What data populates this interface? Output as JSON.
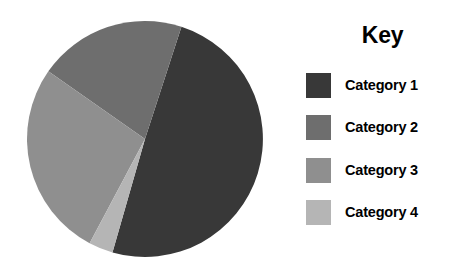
{
  "chart_data": {
    "type": "pie",
    "title": "",
    "legend_title": "Key",
    "legend_position": "right",
    "grid": false,
    "categories": [
      "Category 1",
      "Category 2",
      "Category 3",
      "Category 4"
    ],
    "values": [
      49,
      20,
      27,
      4
    ],
    "unit": "percent",
    "start_angle_deg": 18,
    "direction": "counterclockwise",
    "slices": [
      {
        "label": "Category 1",
        "value": 49,
        "color": "#383838",
        "start_deg": 18,
        "end_deg": 196
      },
      {
        "label": "Category 2",
        "value": 20,
        "color": "#6e6e6e",
        "start_deg": 305,
        "end_deg": 18
      },
      {
        "label": "Category 3",
        "value": 27,
        "color": "#8f8f8f",
        "start_deg": 208,
        "end_deg": 305
      },
      {
        "label": "Category 4",
        "value": 4,
        "color": "#b5b5b5",
        "start_deg": 196,
        "end_deg": 208
      }
    ],
    "geometry": {
      "center_x": 145,
      "center_y": 139,
      "radius": 118
    }
  },
  "legend": {
    "title": "Key",
    "items": [
      {
        "label": "Category 1",
        "color": "#383838",
        "swatch_icon": "color-swatch-icon"
      },
      {
        "label": "Category 2",
        "color": "#6e6e6e",
        "swatch_icon": "color-swatch-icon"
      },
      {
        "label": "Category 3",
        "color": "#8f8f8f",
        "swatch_icon": "color-swatch-icon"
      },
      {
        "label": "Category 4",
        "color": "#b5b5b5",
        "swatch_icon": "color-swatch-icon"
      }
    ]
  },
  "colors": {
    "background": "#ffffff",
    "text": "#000000",
    "series_1": "#383838",
    "series_2": "#6e6e6e",
    "series_3": "#8f8f8f",
    "series_4": "#b5b5b5"
  }
}
